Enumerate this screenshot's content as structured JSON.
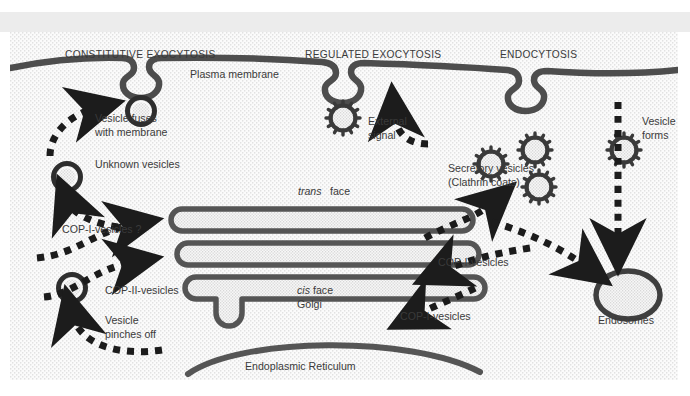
{
  "figure": {
    "title_headings": [
      {
        "id": "constitutive-exocytosis",
        "label": "CONSTITUTIVE EXOCYTOSIS",
        "x": 55,
        "y": 26
      },
      {
        "id": "regulated-exocytosis",
        "label": "REGULATED EXOCYTOSIS",
        "x": 295,
        "y": 26
      },
      {
        "id": "endocytosis",
        "label": "ENDOCYTOSIS",
        "x": 490,
        "y": 26
      }
    ],
    "labels": [
      {
        "id": "plasma-membrane",
        "label": "Plasma membrane",
        "x": 180,
        "y": 46,
        "style": "normal",
        "anchor": "start"
      },
      {
        "id": "vesicle-fuses-1",
        "label": "Vesicle fuses",
        "x": 85,
        "y": 90,
        "style": "normal",
        "anchor": "start"
      },
      {
        "id": "vesicle-fuses-2",
        "label": "with membrane",
        "x": 85,
        "y": 104,
        "style": "normal",
        "anchor": "start"
      },
      {
        "id": "unknown-vesicles",
        "label": "Unknown vesicles",
        "x": 85,
        "y": 136,
        "style": "normal",
        "anchor": "start"
      },
      {
        "id": "external-signal-1",
        "label": "External",
        "x": 358,
        "y": 93,
        "style": "normal",
        "anchor": "start"
      },
      {
        "id": "external-signal-2",
        "label": "signal",
        "x": 358,
        "y": 107,
        "style": "normal",
        "anchor": "start"
      },
      {
        "id": "secretory-vesicles-1",
        "label": "Secretory vesicles",
        "x": 438,
        "y": 140,
        "style": "normal",
        "anchor": "start"
      },
      {
        "id": "secretory-vesicles-2",
        "label": "(Clathrin coats)",
        "x": 438,
        "y": 154,
        "style": "normal",
        "anchor": "start"
      },
      {
        "id": "vesicle-forms-1",
        "label": "Vesicle",
        "x": 632,
        "y": 93,
        "style": "normal",
        "anchor": "start"
      },
      {
        "id": "vesicle-forms-2",
        "label": "forms",
        "x": 632,
        "y": 107,
        "style": "normal",
        "anchor": "start"
      },
      {
        "id": "trans-face",
        "label": "trans",
        "x": 288,
        "y": 163,
        "style": "italic",
        "anchor": "start"
      },
      {
        "id": "trans-face-2",
        "label": "face",
        "x": 320,
        "y": 163,
        "style": "normal",
        "anchor": "start"
      },
      {
        "id": "cop-i-vesicles-left",
        "label": "COP-I-vesicles ?",
        "x": 52,
        "y": 201,
        "style": "normal",
        "anchor": "start"
      },
      {
        "id": "cop-ii-vesicles",
        "label": "COP-II-vesicles",
        "x": 95,
        "y": 262,
        "style": "normal",
        "anchor": "start"
      },
      {
        "id": "vesicle-pinches-1",
        "label": "Vesicle",
        "x": 95,
        "y": 292,
        "style": "normal",
        "anchor": "start"
      },
      {
        "id": "vesicle-pinches-2",
        "label": "pinches off",
        "x": 95,
        "y": 306,
        "style": "normal",
        "anchor": "start"
      },
      {
        "id": "cis-face",
        "label": "cis",
        "x": 287,
        "y": 262,
        "style": "italic",
        "anchor": "start"
      },
      {
        "id": "cis-face-2",
        "label": "face",
        "x": 303,
        "y": 262,
        "style": "normal",
        "anchor": "start"
      },
      {
        "id": "golgi",
        "label": "Golgi",
        "x": 287,
        "y": 276,
        "style": "normal",
        "anchor": "start"
      },
      {
        "id": "cop-i-vesicles-mid",
        "label": "COP-I-vesicles",
        "x": 428,
        "y": 234,
        "style": "normal",
        "anchor": "start"
      },
      {
        "id": "cop-i-vesicles-low",
        "label": "COP-I-vesicles",
        "x": 390,
        "y": 288,
        "style": "normal",
        "anchor": "start"
      },
      {
        "id": "endosomes",
        "label": "Endosomes",
        "x": 588,
        "y": 292,
        "style": "normal",
        "anchor": "start"
      },
      {
        "id": "endoplasmic-reticulum",
        "label": "Endoplasmic Reticulum",
        "x": 235,
        "y": 338,
        "style": "normal",
        "anchor": "start"
      }
    ],
    "colors": {
      "membrane": "#4d4d4d",
      "organelle_stroke": "#555555",
      "cytosol_stipple": "#f4f4f4",
      "arrow": "#1c1c1c",
      "text": "#3a3a3a",
      "band_gray": "#ececec",
      "page_white": "#ffffff"
    },
    "organelles": {
      "golgi_cisternae_count": 3,
      "clathrin_vesicle_count": 5,
      "smooth_vesicle_count": 2,
      "endosome_count": 1,
      "endoplasmic_reticulum_count": 1,
      "membrane_invagination_count": 3
    },
    "pathway_arrows": [
      {
        "id": "arrow-unknown-to-pm",
        "from": "unknown-vesicle",
        "to": "plasma-membrane"
      },
      {
        "id": "arrow-golgi-to-unknown",
        "from": "golgi-trans",
        "to": "unknown-vesicle"
      },
      {
        "id": "arrow-copi-upper",
        "from": "left-cytosol",
        "to": "golgi-trans"
      },
      {
        "id": "arrow-copi-lower",
        "from": "left-cytosol",
        "to": "golgi-middle"
      },
      {
        "id": "arrow-copii-from-er",
        "from": "endoplasmic-reticulum",
        "to": "cop-ii-vesicle"
      },
      {
        "id": "arrow-external-signal",
        "from": "external-signal",
        "to": "plasma-membrane"
      },
      {
        "id": "arrow-golgi-to-secretory",
        "from": "golgi-trans",
        "to": "secretory-vesicles"
      },
      {
        "id": "arrow-endocytic-to-endosome",
        "from": "plasma-membrane",
        "to": "endosomes"
      },
      {
        "id": "arrow-endosome-to-golgi",
        "from": "endosomes",
        "to": "golgi-cis"
      },
      {
        "id": "arrow-er-to-golgi",
        "from": "endoplasmic-reticulum",
        "to": "golgi-cis"
      }
    ]
  }
}
